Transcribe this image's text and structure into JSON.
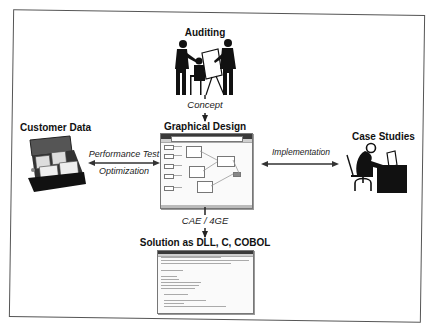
{
  "diagram": {
    "nodes": {
      "auditing": {
        "label": "Auditing",
        "icon": "people-at-drafting-table-icon"
      },
      "graphical_design": {
        "label": "Graphical Design",
        "icon": "diagram-editor-window-icon"
      },
      "customer_data": {
        "label": "Customer Data",
        "icon": "card-file-box-icon"
      },
      "case_studies": {
        "label": "Case Studies",
        "icon": "person-at-desk-icon"
      },
      "solution": {
        "label": "Solution as DLL, C, COBOL",
        "icon": "code-listing-window-icon"
      }
    },
    "edges": {
      "concept": {
        "label": "Concept",
        "from": "Auditing",
        "to": "Graphical Design",
        "direction": "down"
      },
      "performance": {
        "label_line1": "Performance Test",
        "label_line2": "Optimization",
        "from": "Customer Data",
        "to": "Graphical Design",
        "direction": "bidirectional"
      },
      "implementation": {
        "label": "Implementation",
        "from": "Case Studies",
        "to": "Graphical Design",
        "direction": "bidirectional"
      },
      "cae": {
        "label": "CAE / 4GE",
        "from": "Graphical Design",
        "to": "Solution as DLL, C, COBOL",
        "direction": "down"
      }
    }
  },
  "colors": {
    "frame": "#555555",
    "ink": "#111111",
    "background": "#ffffff"
  }
}
